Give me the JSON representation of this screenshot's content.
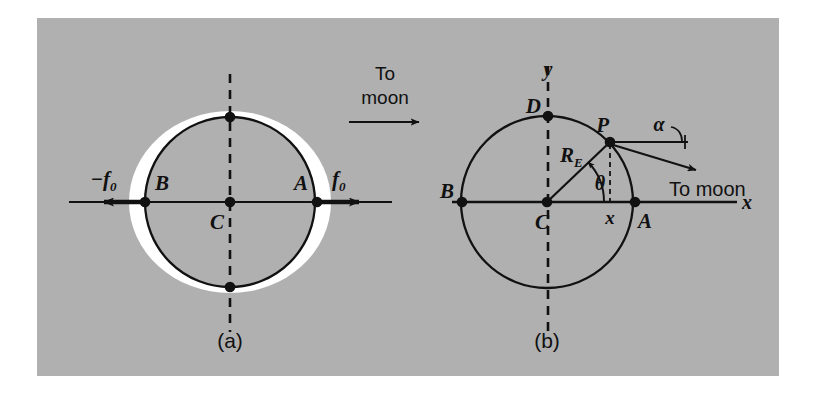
{
  "figure": {
    "background_color": "#b0b0b0",
    "ink_color": "#111111",
    "bulge_color": "#ffffff",
    "panels": [
      {
        "id": "a",
        "caption": "(a)",
        "points": [
          {
            "name": "B",
            "label": "B"
          },
          {
            "name": "C",
            "label": "C"
          },
          {
            "name": "A",
            "label": "A"
          },
          {
            "name": "top",
            "label": ""
          },
          {
            "name": "bottom",
            "label": ""
          }
        ],
        "force_left": {
          "label": "−f",
          "sub": "0"
        },
        "force_right": {
          "label": "f",
          "sub": "0"
        },
        "to_moon": {
          "line1": "To",
          "line2": "moon"
        }
      },
      {
        "id": "b",
        "caption": "(b)",
        "axis_x_label": "x",
        "axis_y_label": "y",
        "points": [
          {
            "name": "B",
            "label": "B"
          },
          {
            "name": "C",
            "label": "C"
          },
          {
            "name": "A",
            "label": "A"
          },
          {
            "name": "D",
            "label": "D"
          },
          {
            "name": "P",
            "label": "P"
          }
        ],
        "radius_label": {
          "label": "R",
          "sub": "E"
        },
        "theta_label": "θ",
        "alpha_label": "α",
        "x_coord_label": "x",
        "to_moon": "To moon"
      }
    ]
  }
}
